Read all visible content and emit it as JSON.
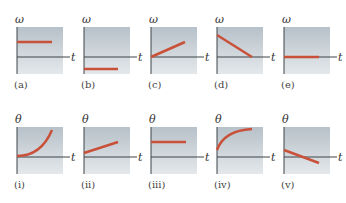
{
  "colors": {
    "curve": "#c9513a",
    "axis": "#3c4448",
    "bg_top": "#b7c1c9",
    "bg_bottom": "#e4e8eb"
  },
  "top_row": {
    "y_axis_symbol": "ω",
    "x_axis_symbol": "t",
    "panels": [
      {
        "id": "a",
        "caption": "(a)",
        "description": "constant positive ω"
      },
      {
        "id": "b",
        "caption": "(b)",
        "description": "constant negative ω"
      },
      {
        "id": "c",
        "caption": "(c)",
        "description": "ω increasing linearly from zero"
      },
      {
        "id": "d",
        "caption": "(d)",
        "description": "ω decreasing linearly to zero"
      },
      {
        "id": "e",
        "caption": "(e)",
        "description": "ω equal to zero"
      }
    ]
  },
  "bottom_row": {
    "y_axis_symbol": "θ",
    "x_axis_symbol": "t",
    "panels": [
      {
        "id": "i",
        "caption": "(i)",
        "description": "θ increasing at increasing rate"
      },
      {
        "id": "ii",
        "caption": "(ii)",
        "description": "θ increasing linearly"
      },
      {
        "id": "iii",
        "caption": "(iii)",
        "description": "θ constant positive"
      },
      {
        "id": "iv",
        "caption": "(iv)",
        "description": "θ increasing at decreasing rate"
      },
      {
        "id": "v",
        "caption": "(v)",
        "description": "θ decreasing linearly through zero"
      }
    ]
  }
}
